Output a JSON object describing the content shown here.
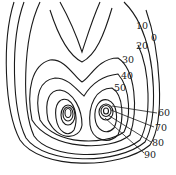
{
  "diagram": {
    "type": "contour-map",
    "labels": [
      {
        "id": "l10",
        "text": "10",
        "x": 136,
        "y": 21
      },
      {
        "id": "l0",
        "text": "0",
        "x": 151,
        "y": 33
      },
      {
        "id": "l20",
        "text": "20",
        "x": 136,
        "y": 41
      },
      {
        "id": "l30",
        "text": "30",
        "x": 122,
        "y": 55
      },
      {
        "id": "l40",
        "text": "40",
        "x": 121,
        "y": 71
      },
      {
        "id": "l50",
        "text": "50",
        "x": 114,
        "y": 83
      },
      {
        "id": "l60",
        "text": "60",
        "x": 158,
        "y": 107
      },
      {
        "id": "l70",
        "text": "70",
        "x": 155,
        "y": 124
      },
      {
        "id": "l80",
        "text": "80",
        "x": 152,
        "y": 139
      },
      {
        "id": "l90",
        "text": "90",
        "x": 144,
        "y": 151
      }
    ],
    "contour_levels": [
      0,
      10,
      20,
      30,
      40,
      50,
      60,
      70,
      80,
      90
    ],
    "line_color": "#1a1a1a"
  }
}
